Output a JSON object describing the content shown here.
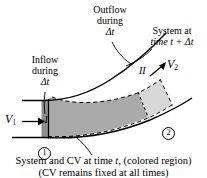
{
  "figure": {
    "type": "fluid-mechanics-control-volume-diagram",
    "background_color": "#ffffff",
    "stroke_color": "#000000",
    "system_fill_color": "#aaaaaa",
    "region_i_fill_color": "#8f8f8f",
    "region_ii_fill_color": "#d8d8d8"
  },
  "labels": {
    "inflow": {
      "line1": "Inflow",
      "line2": "during",
      "line3": "Δt"
    },
    "outflow": {
      "line1": "Outflow",
      "line2": "during",
      "line3": "Δt"
    },
    "system_at_time": {
      "line1": "System at",
      "line2": "time t + Δt"
    },
    "region_one": "I",
    "region_two": "II",
    "velocity_in": {
      "symbol": "V",
      "subscript": "1"
    },
    "velocity_out": {
      "symbol": "V",
      "subscript": "2"
    },
    "station_one": "1",
    "station_two": "2",
    "caption": {
      "line1_part1": "System and CV at time ",
      "line1_italic": "t",
      "line1_part2": ", (colored region)",
      "line2": "(CV remains fixed at all times)"
    }
  }
}
